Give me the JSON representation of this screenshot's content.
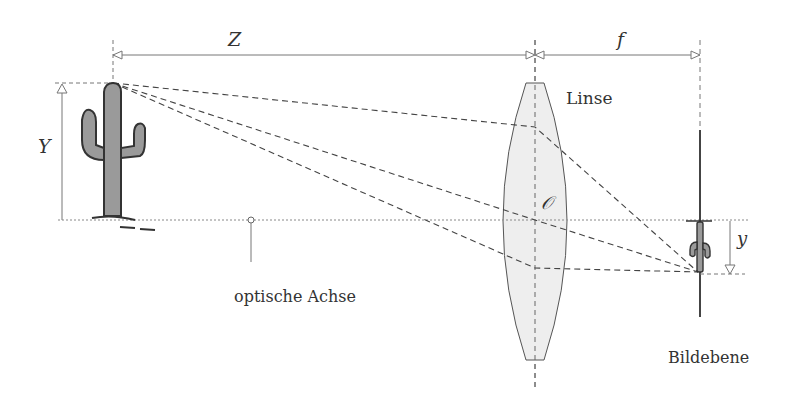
{
  "diagram": {
    "labels": {
      "object_distance": "Z",
      "focal_length": "f",
      "object_height": "Y",
      "image_height": "y",
      "lens": "Linse",
      "optical_center": "𝒪",
      "optical_axis": "optische Achse",
      "image_plane": "Bildebene"
    },
    "colors": {
      "line": "#555555",
      "lens_fill": "#eeeeee",
      "cactus_fill": "#9a9a9a",
      "cactus_outline": "#333333"
    }
  }
}
